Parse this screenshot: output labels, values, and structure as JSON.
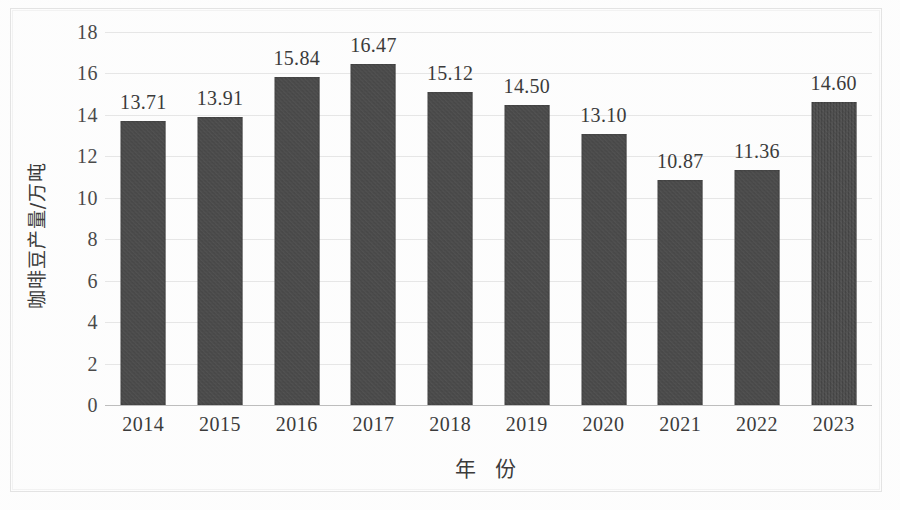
{
  "chart_data": {
    "type": "bar",
    "title": "",
    "subtitle": "",
    "xlabel": "年  份",
    "ylabel": "咖啡豆产量/万吨",
    "categories": [
      "2014",
      "2015",
      "2016",
      "2017",
      "2018",
      "2019",
      "2020",
      "2021",
      "2022",
      "2023"
    ],
    "values": [
      13.71,
      13.91,
      15.84,
      16.47,
      15.12,
      14.5,
      13.1,
      10.87,
      11.36,
      14.6
    ],
    "value_labels": [
      "13.71",
      "13.91",
      "15.84",
      "16.47",
      "15.12",
      "14.50",
      "13.10",
      "10.87",
      "11.36",
      "14.60"
    ],
    "ylim": [
      0,
      18
    ],
    "ytick_step": 2,
    "ytick_labels": [
      "18",
      "16",
      "14",
      "12",
      "10",
      "8",
      "6",
      "4",
      "2",
      "0"
    ],
    "ytick_values": [
      18,
      16,
      14,
      12,
      10,
      8,
      6,
      4,
      2,
      0
    ],
    "grid": true,
    "grid_axis": "y",
    "legend": false,
    "legend_position": "none",
    "series": [
      {
        "name": "咖啡豆产量",
        "values": [
          13.71,
          13.91,
          15.84,
          16.47,
          15.12,
          14.5,
          13.1,
          10.87,
          11.36,
          14.6
        ]
      }
    ],
    "colors": {
      "bar": "#474747",
      "gridline": "#e6e6e6",
      "axis": "#bdbdbd",
      "text": "#3b3b3b",
      "background": "#fdfdfd",
      "frame": "#e3e3e3"
    }
  }
}
